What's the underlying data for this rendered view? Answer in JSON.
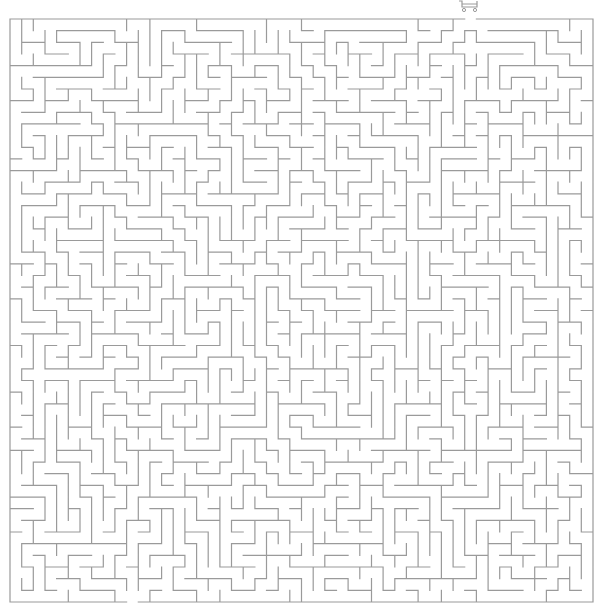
{
  "maze": {
    "cols": 50,
    "rows": 50,
    "origin_x": 10,
    "origin_y": 19,
    "cell_size": 11.66,
    "wall_color": "#9a9a9a",
    "wall_width": 1.2,
    "background": "#ffffff",
    "entrance": {
      "side": "top",
      "col": 39
    },
    "exit": {
      "side": "bottom",
      "col": 10
    },
    "seed": 7919
  },
  "start_marker": {
    "icon": "shopping-cart-icon",
    "color": "#9a9a9a"
  }
}
